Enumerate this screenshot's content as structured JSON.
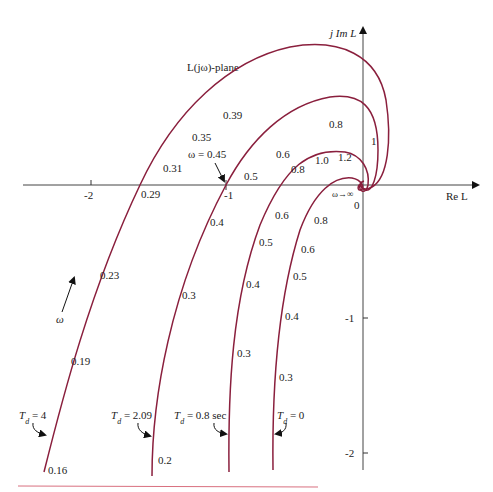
{
  "title": "L(jω)-plane",
  "axes": {
    "x_label": "Re L",
    "y_label": "j Im L",
    "x_ticks": [
      "-2",
      "-1"
    ],
    "y_ticks": [
      "-1",
      "-2"
    ],
    "origin_label": "0",
    "infinity_label": "ω→∞"
  },
  "annotations": {
    "omega_arrow_label": "ω",
    "omega_045": "ω = 0.45"
  },
  "curves": [
    {
      "name": "Td = 4",
      "label": "T_d = 4",
      "label_main": "T",
      "label_sub": "d",
      "label_rest": " = 4",
      "freq_labels": [
        "0.16",
        "0.19",
        "0.23",
        "0.29",
        "0.31",
        "0.35",
        "0.39"
      ]
    },
    {
      "name": "Td = 2.09",
      "label_main": "T",
      "label_sub": "d",
      "label_rest": " = 2.09",
      "freq_labels": [
        "0.2",
        "0.3",
        "0.4",
        "0.5",
        "0.6",
        "0.8",
        "1"
      ]
    },
    {
      "name": "Td = 0.8 sec",
      "label_main": "T",
      "label_sub": "d",
      "label_rest": " = 0.8 sec",
      "freq_labels": [
        "0.3",
        "0.4",
        "0.5",
        "0.6",
        "0.8",
        "1.0",
        "1.2"
      ]
    },
    {
      "name": "Td = 0",
      "label_main": "T",
      "label_sub": "d",
      "label_rest": " = 0",
      "freq_labels": [
        "0.3",
        "0.4",
        "0.5",
        "0.6",
        "0.8"
      ]
    }
  ],
  "colors": {
    "curve": "#8a1f3d",
    "axis": "#444444",
    "rule": "#d9707f"
  }
}
